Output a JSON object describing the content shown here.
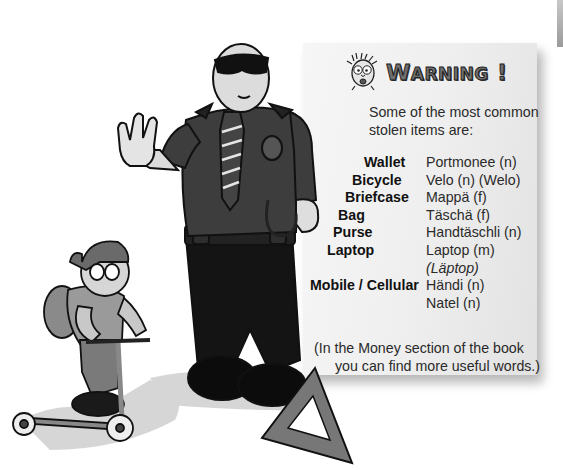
{
  "warning": {
    "title_first": "W",
    "title_rest": "ARNING",
    "title_mark": " !",
    "icon": "shocked-face-icon"
  },
  "intro": "Some of the most common stolen items are:",
  "items": [
    {
      "english": "Wallet",
      "swiss": "Portmonee (n)"
    },
    {
      "english": "Bicycle",
      "swiss": "Velo (n) (Welo)"
    },
    {
      "english": "Briefcase",
      "swiss": "Mappä (f)"
    },
    {
      "english": "Bag",
      "swiss": "Täschä (f)"
    },
    {
      "english": "Purse",
      "swiss": "Handtäschli (n)"
    },
    {
      "english": "Laptop",
      "swiss": "Laptop (m)"
    },
    {
      "english": "",
      "swiss": "(Läptop)",
      "italic": true
    },
    {
      "english": "Mobile / Cellular",
      "swiss": "Händi (n)"
    },
    {
      "english": "",
      "swiss": "Natel (n)"
    }
  ],
  "footer": {
    "line1": "(In the Money section of the book",
    "line2": "you can find more useful words.)"
  },
  "illustrations": {
    "police_officer": "police-officer-stop-gesture",
    "child": "child-on-kick-scooter",
    "triangle": "warning-triangle"
  },
  "colors": {
    "panel_bg": "#efefef",
    "text": "#2a2a2a",
    "title_fill": "#6f6f6f",
    "uniform": "#3a3a3a",
    "trousers": "#141414"
  }
}
